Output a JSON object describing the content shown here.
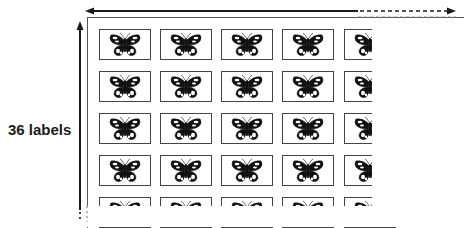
{
  "figure": {
    "side_label": "36 labels",
    "grid": {
      "visible_columns": 5,
      "visible_rows": 5,
      "label_icon": "butterfly-icon",
      "column_x": [
        99,
        160,
        221,
        282,
        344
      ],
      "row_y": [
        29,
        71,
        113,
        155,
        197
      ]
    },
    "colors": {
      "ink": "#1a1a1a",
      "border": "#444444",
      "dash": "#888888"
    }
  }
}
